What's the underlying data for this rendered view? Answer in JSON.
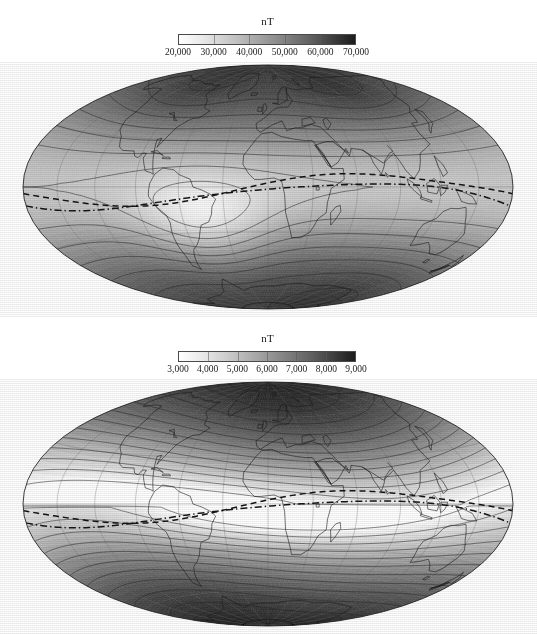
{
  "figure": {
    "kind": "two-panel world map",
    "projection": "Hammer-Aitoff equal-area global projection",
    "background_color": "#ffffff",
    "ink_color": "#1a1a1a"
  },
  "panels": [
    {
      "id": "total-intensity",
      "colorbar": {
        "title": "nT",
        "orientation": "horizontal",
        "low_color": "#ffffff",
        "high_color": "#1c1c1c",
        "min": 20000,
        "max": 70000,
        "tick_labels": [
          "20,000",
          "30,000",
          "40,000",
          "50,000",
          "60,000",
          "70,000"
        ],
        "tick_values": [
          20000,
          30000,
          40000,
          50000,
          60000,
          70000
        ]
      },
      "map": {
        "contour_interval_nT": 5000,
        "has_coastlines": true,
        "has_graticule": true,
        "graticule_spacing_deg": 30,
        "dashed_line_label": "dip equator",
        "dashed_line_count": 2,
        "minimum_region": "South Atlantic Anomaly",
        "maximum_regions": [
          "northern Canada",
          "Siberia",
          "southern Indian Ocean / Antarctica"
        ]
      }
    },
    {
      "id": "secular-variation-or-secondary-field",
      "colorbar": {
        "title": "nT",
        "orientation": "horizontal",
        "low_color": "#ffffff",
        "high_color": "#1c1c1c",
        "min": 3000,
        "max": 9000,
        "tick_labels": [
          "3,000",
          "4,000",
          "5,000",
          "6,000",
          "7,000",
          "8,000",
          "9,000"
        ],
        "tick_values": [
          3000,
          4000,
          5000,
          6000,
          7000,
          8000,
          9000
        ]
      },
      "map": {
        "contour_interval_nT": 500,
        "has_coastlines": true,
        "has_graticule": true,
        "graticule_spacing_deg": 30,
        "dashed_line_label": "dip equator",
        "dashed_line_count": 2,
        "minimum_region": "equatorial belt (Atlantic - Africa)",
        "maximum_regions": [
          "polar regions (north and south)"
        ]
      }
    }
  ],
  "chart_data": [
    {
      "type": "heatmap",
      "title": "nT",
      "subtitle": "",
      "xlabel": "",
      "ylabel": "",
      "legend_position": "top",
      "grid": true,
      "colorbar_label": "nT",
      "colorbar_ticks": [
        20000,
        30000,
        40000,
        50000,
        60000,
        70000
      ],
      "colorbar_tick_labels": [
        "20,000",
        "30,000",
        "40,000",
        "50,000",
        "60,000",
        "70,000"
      ],
      "colormap": [
        "#ffffff",
        "#1c1c1c"
      ],
      "zlim": [
        20000,
        70000
      ],
      "contour_levels": [
        20000,
        25000,
        30000,
        35000,
        40000,
        45000,
        50000,
        55000,
        60000,
        65000,
        70000
      ],
      "xlim": [
        -180,
        180
      ],
      "ylim": [
        -90,
        90
      ],
      "annotations": [
        "dip equator (dashed)",
        "dip equator (dash-dot)"
      ]
    },
    {
      "type": "heatmap",
      "title": "nT",
      "subtitle": "",
      "xlabel": "",
      "ylabel": "",
      "legend_position": "top",
      "grid": true,
      "colorbar_label": "nT",
      "colorbar_ticks": [
        3000,
        4000,
        5000,
        6000,
        7000,
        8000,
        9000
      ],
      "colorbar_tick_labels": [
        "3,000",
        "4,000",
        "5,000",
        "6,000",
        "7,000",
        "8,000",
        "9,000"
      ],
      "colormap": [
        "#ffffff",
        "#1c1c1c"
      ],
      "zlim": [
        3000,
        9000
      ],
      "contour_levels": [
        3000,
        3500,
        4000,
        4500,
        5000,
        5500,
        6000,
        6500,
        7000,
        7500,
        8000,
        8500,
        9000
      ],
      "xlim": [
        -180,
        180
      ],
      "ylim": [
        -90,
        90
      ],
      "annotations": [
        "dip equator (dashed)",
        "dip equator (dash-dot)"
      ]
    }
  ]
}
